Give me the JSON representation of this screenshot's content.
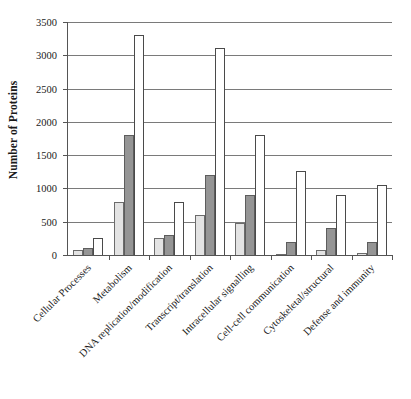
{
  "chart_data": {
    "type": "bar",
    "title": "",
    "subtitle": "",
    "xlabel": "",
    "ylabel": "Number of Proteins",
    "ylim": [
      0,
      3500
    ],
    "y_ticks": [
      0,
      500,
      1000,
      1500,
      2000,
      2500,
      3000,
      3500
    ],
    "y_tick_labels": [
      "0",
      "500",
      "1000",
      "1500",
      "2000",
      "2500",
      "3000",
      "3500"
    ],
    "grid": "horizontal",
    "legend": "none",
    "categories": [
      "Cellular Processes",
      "Metabolism",
      "DNA replication/modification",
      "Transcript/translation",
      "Intracellular signalling",
      "Cell-cell communication",
      "Cytoskeletal/structural",
      "Defense and immunity"
    ],
    "series": [
      {
        "name": "series-1",
        "color": "#e3e3e3",
        "values": [
          75,
          800,
          250,
          600,
          480,
          20,
          70,
          30
        ]
      },
      {
        "name": "series-2",
        "color": "#959595",
        "values": [
          110,
          1800,
          300,
          1200,
          900,
          195,
          400,
          200
        ]
      },
      {
        "name": "series-3",
        "color": "#ffffff",
        "values": [
          250,
          3300,
          790,
          3110,
          1810,
          1265,
          900,
          1050
        ]
      }
    ]
  },
  "colors": {
    "axis": "#555555",
    "gridline": "#7a7a7a",
    "bar_border": "#6b6b6b",
    "background": "#ffffff",
    "text": "#1a1a1a"
  }
}
